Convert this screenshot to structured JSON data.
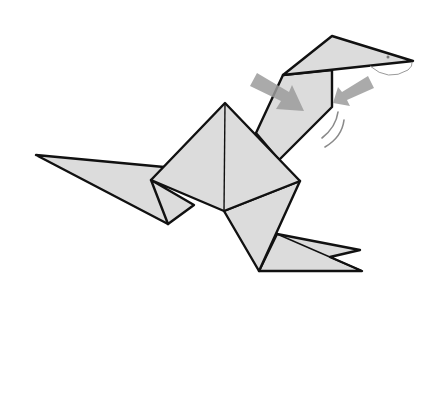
{
  "diagram": {
    "colors": {
      "paper_fill": "#dcdcdc",
      "outline": "#111111",
      "arrow_fill": "#9b9b9b",
      "background": "#ffffff"
    },
    "parts": [
      {
        "name": "head",
        "points": [
          [
            283,
            75
          ],
          [
            332,
            36
          ],
          [
            413,
            61
          ]
        ]
      },
      {
        "name": "neck",
        "points": [
          [
            283,
            75
          ],
          [
            332,
            70
          ],
          [
            332,
            107
          ],
          [
            279,
            160
          ],
          [
            256,
            133
          ]
        ]
      },
      {
        "name": "tail",
        "points": [
          [
            36,
            155
          ],
          [
            164,
            167
          ],
          [
            168,
            224
          ]
        ]
      },
      {
        "name": "body-diamond",
        "points": [
          [
            225,
            103
          ],
          [
            300,
            181
          ],
          [
            224,
            211
          ],
          [
            151,
            180
          ]
        ]
      },
      {
        "name": "back-leg",
        "points": [
          [
            151,
            180
          ],
          [
            192,
            206
          ],
          [
            168,
            224
          ]
        ]
      },
      {
        "name": "front-leg",
        "points": [
          [
            224,
            211
          ],
          [
            300,
            181
          ],
          [
            259,
            271
          ]
        ]
      },
      {
        "name": "feet",
        "points": [
          [
            277,
            234
          ],
          [
            360,
            250
          ],
          [
            330,
            257
          ],
          [
            362,
            271
          ],
          [
            259,
            271
          ]
        ]
      }
    ],
    "arrows": [
      {
        "name": "push-arrow-left",
        "from": [
          253,
          79
        ],
        "to": [
          303,
          110
        ]
      },
      {
        "name": "push-arrow-right",
        "from": [
          371,
          82
        ],
        "to": [
          333,
          100
        ]
      }
    ],
    "symbols": {
      "eye": [
        388,
        57
      ],
      "fold-arc": "beak-pivot",
      "motion-lines": "neck-swing"
    }
  }
}
